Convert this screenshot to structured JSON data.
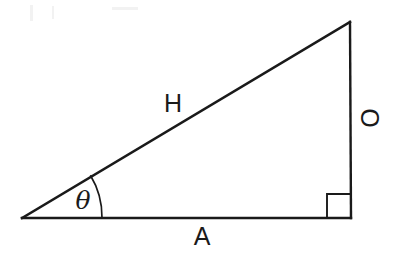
{
  "figure": {
    "background_color": "#ffffff",
    "stroke_color": "#1a1a1a"
  },
  "geometry": {
    "vertices": {
      "left_angle_vertex": {
        "label": "theta-vertex",
        "x": 22,
        "y": 218
      },
      "right_angle_vertex": {
        "label": "right-angle-vertex",
        "x": 351,
        "y": 218
      },
      "apex_vertex": {
        "label": "apex-vertex",
        "x": 350,
        "y": 22
      }
    },
    "angle_arc": {
      "center_x": 22,
      "center_y": 218,
      "radius": 80
    },
    "right_angle_marker": {
      "x": 327,
      "y": 194,
      "size": 24
    }
  },
  "labels": {
    "hypotenuse": "H",
    "opposite": "O",
    "adjacent": "A",
    "angle": "θ"
  }
}
